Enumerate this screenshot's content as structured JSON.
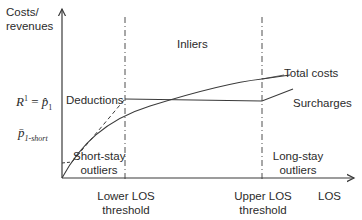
{
  "diagram": {
    "y_axis_label_line1": "Costs/",
    "y_axis_label_line2": "revenues",
    "x_axis_label": "LOS",
    "regions": {
      "inliers": "Inliers",
      "short_stay_line1": "Short-stay",
      "short_stay_line2": "outliers",
      "long_stay_line1": "Long-stay",
      "long_stay_line2": "outliers"
    },
    "thresholds": {
      "lower_line1": "Lower LOS",
      "lower_line2": "threshold",
      "upper_line1": "Upper LOS",
      "upper_line2": "threshold"
    },
    "curves": {
      "total_costs": "Total costs",
      "deductions": "Deductions",
      "surcharges": "Surcharges"
    },
    "y_markers": {
      "r1_base": "R",
      "r1_sup": "1",
      "r1_eq": " = ",
      "p1_hat": "p̂",
      "p1_sub": "1",
      "p_short": "p̄",
      "p_short_sub": "1-short"
    },
    "colors": {
      "line": "#3a3a3a",
      "text": "#2b2b2b",
      "background": "#ffffff"
    }
  }
}
